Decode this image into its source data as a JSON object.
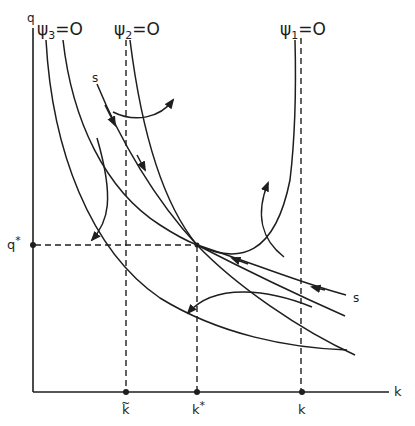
{
  "diagram": {
    "type": "phase-diagram",
    "axes": {
      "x_label": "k",
      "y_label": "q"
    },
    "isoclines": [
      {
        "label_base": "ψ",
        "label_sub": "3",
        "label_eq": "=O"
      },
      {
        "label_base": "ψ",
        "label_sub": "2",
        "label_eq": "=O"
      },
      {
        "label_base": "ψ",
        "label_sub": "1",
        "label_eq": "=O"
      }
    ],
    "x_ticks": [
      {
        "label": "k",
        "accent": "~",
        "name": "k-tilde"
      },
      {
        "label": "k",
        "accent": "*",
        "name": "k-star"
      },
      {
        "label": "k",
        "accent": "",
        "name": "k-bar"
      }
    ],
    "y_ticks": [
      {
        "label": "q",
        "accent": "*",
        "name": "q-star"
      }
    ],
    "saddle_path_labels": [
      "s",
      "s"
    ],
    "colors": {
      "ink": "#1e1e1e",
      "background": "#ffffff"
    }
  }
}
